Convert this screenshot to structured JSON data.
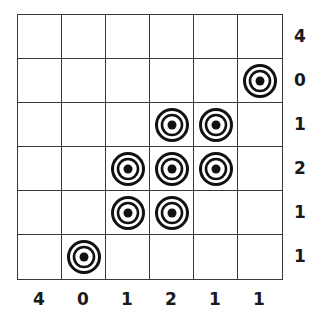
{
  "puzzle": {
    "rows": 6,
    "cols": 6,
    "row_clues": [
      "4",
      "0",
      "1",
      "2",
      "1",
      "1"
    ],
    "col_clues": [
      "4",
      "0",
      "1",
      "2",
      "1",
      "1"
    ],
    "targets": [
      [
        0,
        0,
        0,
        0,
        0,
        0
      ],
      [
        0,
        0,
        0,
        0,
        0,
        1
      ],
      [
        0,
        0,
        0,
        1,
        1,
        0
      ],
      [
        0,
        0,
        1,
        1,
        1,
        0
      ],
      [
        0,
        0,
        1,
        1,
        0,
        0
      ],
      [
        0,
        1,
        0,
        0,
        0,
        0
      ]
    ],
    "target_icon": "bullseye-icon"
  }
}
